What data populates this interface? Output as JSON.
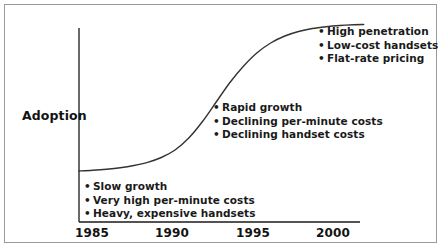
{
  "chart_data": {
    "type": "line",
    "title": "",
    "xlabel": "",
    "ylabel": "Adoption",
    "xlim": [
      1985,
      2001.5
    ],
    "ylim": [
      0,
      1
    ],
    "grid": false,
    "legend": null,
    "x_tick_labels": [
      "1985",
      "1990",
      "1995",
      "2000"
    ],
    "x_tick_values": [
      1985,
      1990,
      1995,
      2000
    ],
    "y_tick_labels": [],
    "series": [
      {
        "name": "Adoption S-curve",
        "color": "#333333",
        "x": [
          1985.0,
          1985.8,
          1986.6,
          1987.4,
          1988.2,
          1989.0,
          1989.8,
          1990.6,
          1991.4,
          1992.2,
          1993.0,
          1993.8,
          1994.6,
          1995.4,
          1996.2,
          1997.0,
          1997.8,
          1998.6,
          1999.4,
          2000.2,
          2001.0,
          2001.6
        ],
        "y": [
          0.02,
          0.025,
          0.032,
          0.042,
          0.057,
          0.078,
          0.11,
          0.16,
          0.24,
          0.35,
          0.48,
          0.61,
          0.72,
          0.81,
          0.875,
          0.92,
          0.95,
          0.97,
          0.982,
          0.99,
          0.995,
          0.997
        ]
      }
    ],
    "annotations": [
      {
        "id": "early",
        "position": "bottom-left",
        "items": [
          "Slow growth",
          "Very high per-minute costs",
          "Heavy, expensive handsets"
        ]
      },
      {
        "id": "growth",
        "position": "middle",
        "items": [
          "Rapid growth",
          "Declining per-minute costs",
          "Declining handset costs"
        ]
      },
      {
        "id": "mature",
        "position": "top-right",
        "items": [
          "High penetration",
          "Low-cost handsets",
          "Flat-rate pricing"
        ]
      }
    ],
    "bullet_glyph": "•"
  },
  "colors": {
    "curve": "#333333",
    "axis": "#1a1a1a",
    "text": "#1a1a1a",
    "frame": "#9a9a9a",
    "background": "#ffffff"
  }
}
